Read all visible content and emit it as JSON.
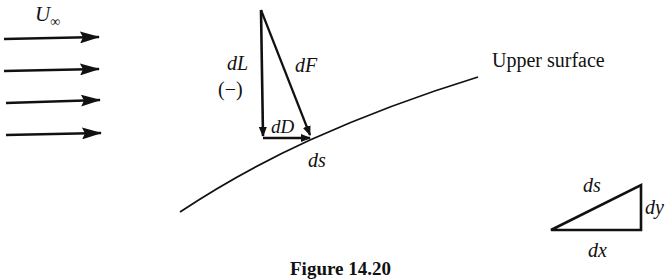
{
  "figure": {
    "caption": "Figure 14.20",
    "freestream": {
      "symbol": "U",
      "subscript": "∞",
      "arrow_count": 4
    },
    "force_triangle": {
      "lift_label": "dL",
      "lift_sign": "(−)",
      "resultant_label": "dF",
      "drag_label": "dD",
      "element_label": "ds"
    },
    "surface_label": "Upper surface",
    "geometry_triangle": {
      "hypotenuse_label": "ds",
      "vertical_label": "dy",
      "horizontal_label": "dx"
    },
    "colors": {
      "ink": "#111111",
      "background": "#ffffff"
    }
  }
}
